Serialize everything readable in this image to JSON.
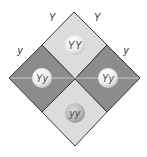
{
  "diagram": {
    "type": "punnett-square-rotated",
    "colors": {
      "light_cell": "#dcdcdc",
      "dark_cell": "#8c8c8c",
      "border": "#3a3a3a",
      "sphere_light": "#f4f4f4",
      "sphere_dark": "#b5b5b5"
    },
    "parent_labels": {
      "top_left": "Y",
      "top_right": "Y",
      "left": "y",
      "right": "y"
    },
    "cells": [
      {
        "position": "top",
        "genotype": "YY",
        "shade": "light"
      },
      {
        "position": "left",
        "genotype": "Yy",
        "shade": "dark"
      },
      {
        "position": "right",
        "genotype": "Yy",
        "shade": "dark"
      },
      {
        "position": "bottom",
        "genotype": "yy",
        "shade": "light"
      }
    ]
  }
}
